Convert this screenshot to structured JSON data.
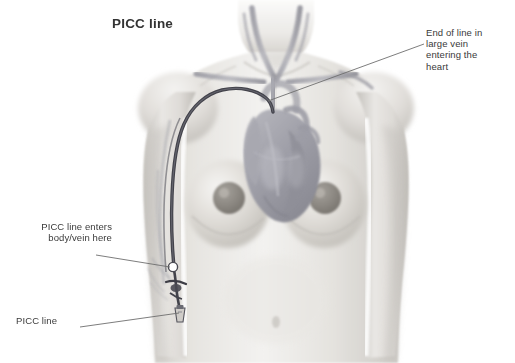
{
  "illustration": {
    "title": "PICC line",
    "subject": "female-torso-anterior-view",
    "style": "grayscale-medical-illustration",
    "background_color": "#ffffff",
    "text_color": "#3a3a3a",
    "title_color": "#333333",
    "leader_line_color": "#6b6b6b",
    "catheter_color": "#4a4a52",
    "vein_color": "#7a7a86",
    "skin_light": "#f2f1ef",
    "skin_mid": "#d8d6d2",
    "skin_shadow": "#b8b5b0",
    "heart_color": "#9a9aa2",
    "marker_color": "#ffffff"
  },
  "annotations": {
    "end_of_line": {
      "text": "End of line in\nlarge vein\nentering the\nheart",
      "lines": [
        "End of line in",
        "large vein",
        "entering the",
        "heart"
      ],
      "position": "top-right",
      "points_to": "superior-vena-cava"
    },
    "enters_body": {
      "text": "PICC line enters\nbody/vein here",
      "lines": [
        "PICC line enters",
        "body/vein here"
      ],
      "position": "mid-left",
      "points_to": "insertion-site-upper-arm"
    },
    "picc_line": {
      "text": "PICC line",
      "lines": [
        "PICC line"
      ],
      "position": "bottom-left",
      "points_to": "external-catheter-hub"
    }
  }
}
